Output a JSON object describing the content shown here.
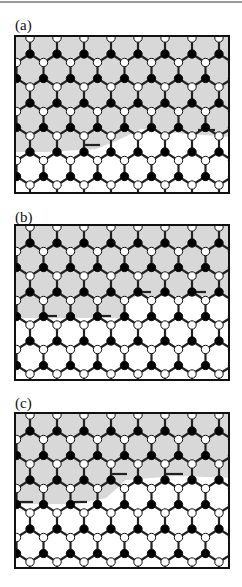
{
  "figure": {
    "panels": [
      {
        "id": "a",
        "label": "(a)",
        "label_top": 18,
        "box": {
          "top": 35,
          "height": 159
        },
        "gray_region": [
          [
            0,
            0
          ],
          [
            216,
            0
          ],
          [
            216,
            100
          ],
          [
            160,
            96
          ],
          [
            125,
            92
          ],
          [
            100,
            104
          ],
          [
            80,
            112
          ],
          [
            30,
            115
          ],
          [
            0,
            115
          ]
        ],
        "shift_row": 3,
        "shift_cols_from": 4,
        "shift_dx": 13.5,
        "defect_bonds": [
          [
            68,
            108,
            84,
            108
          ],
          [
            182,
            93,
            199,
            93
          ]
        ]
      },
      {
        "id": "b",
        "label": "(b)",
        "label_top": 210,
        "box": {
          "top": 224,
          "height": 157
        },
        "gray_region": [
          [
            0,
            0
          ],
          [
            216,
            0
          ],
          [
            216,
            70
          ],
          [
            120,
            70
          ],
          [
            110,
            76
          ],
          [
            110,
            92
          ],
          [
            0,
            92
          ]
        ],
        "shift_row": 3,
        "shift_cols_from": 4,
        "shift_dx": 13.5,
        "defect_bonds": [
          [
            24,
            90,
            41,
            90
          ],
          [
            78,
            90,
            95,
            90
          ],
          [
            118,
            66,
            135,
            66
          ],
          [
            173,
            66,
            190,
            66
          ]
        ]
      },
      {
        "id": "c",
        "label": "(c)",
        "label_top": 396,
        "box": {
          "top": 412,
          "height": 157
        },
        "gray_region": [
          [
            0,
            0
          ],
          [
            216,
            0
          ],
          [
            216,
            64
          ],
          [
            160,
            62
          ],
          [
            110,
            66
          ],
          [
            90,
            84
          ],
          [
            60,
            90
          ],
          [
            0,
            90
          ]
        ],
        "shift_row": 3,
        "shift_cols_from": 4,
        "shift_dx": 13.5,
        "defect_bonds": [
          [
            0,
            88,
            17,
            88
          ],
          [
            54,
            88,
            71,
            88
          ],
          [
            94,
            60,
            111,
            60
          ],
          [
            150,
            60,
            167,
            60
          ]
        ]
      }
    ]
  },
  "lattice": {
    "spacing_x": 27,
    "bond_vertical": 16,
    "rise_diagonal": 8.5,
    "origin_x": 14,
    "origin_y": 1,
    "rows": 7,
    "cols": 9,
    "node_radius": 4.2,
    "bond_width": 2.2
  },
  "colors": {
    "gray_fill": "#d8d8d8",
    "bond": "#222222",
    "black_node": "#000000",
    "white_node": "#ffffff",
    "node_stroke": "#111111",
    "border": "#111111"
  }
}
